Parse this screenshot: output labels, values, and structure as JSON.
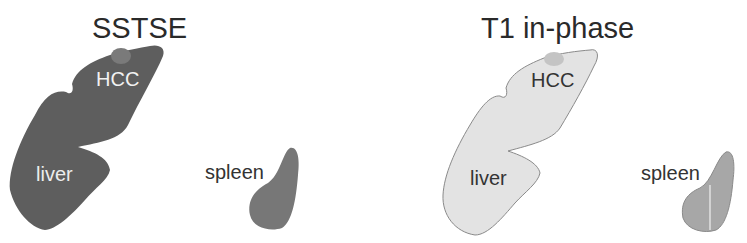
{
  "panels": [
    {
      "title": "SSTSE",
      "labels": {
        "lesion": "HCC",
        "liver": "liver",
        "spleen": "spleen"
      },
      "colors": {
        "liver": "#5e5e5e",
        "lesion": "#7a7a7a",
        "spleen": "#777777",
        "liver_label": "#ededed",
        "lesion_label": "#f2f2f2",
        "spleen_label": "#333333"
      }
    },
    {
      "title": "T1 in-phase",
      "labels": {
        "lesion": "HCC",
        "liver": "liver",
        "spleen": "spleen"
      },
      "colors": {
        "liver": "#e3e3e3",
        "liver_outline": "#8a8a8a",
        "lesion": "#c4c4c4",
        "spleen": "#a7a7a7",
        "liver_label": "#333333",
        "lesion_label": "#333333",
        "spleen_label": "#333333"
      }
    }
  ]
}
